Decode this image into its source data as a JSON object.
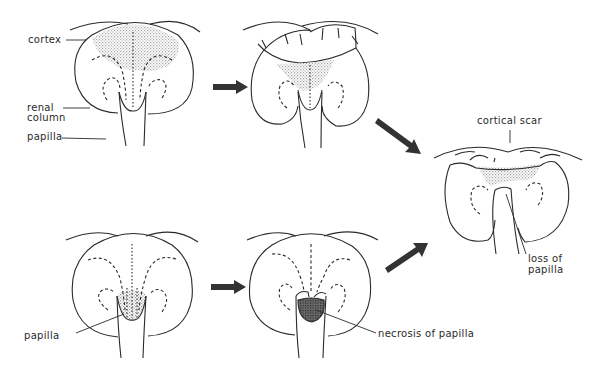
{
  "figure": {
    "colors": {
      "line": "#2a2a2a",
      "stipple": "#b8b8b8",
      "necrosis": "#555555",
      "arrow": "#333333"
    },
    "panels": [
      {
        "id": "top-left",
        "stage": "normal lobe with cortical involvement",
        "labels": [
          "cortex",
          "renal column",
          "papilla"
        ]
      },
      {
        "id": "top-middle",
        "stage": "cortical contraction",
        "labels": []
      },
      {
        "id": "bottom-left",
        "stage": "papillary involvement",
        "labels": [
          "papilla"
        ]
      },
      {
        "id": "bottom-middle",
        "stage": "papillary necrosis",
        "labels": [
          "necrosis of papilla"
        ]
      },
      {
        "id": "right",
        "stage": "end result",
        "labels": [
          "cortical scar",
          "loss of papilla"
        ]
      }
    ],
    "labels": {
      "cortex": "cortex",
      "renal": "renal",
      "column": "column",
      "papilla_top": "papilla",
      "papilla_bottom": "papilla",
      "necrosis": "necrosis of papilla",
      "cortical_scar": "cortical scar",
      "loss_of": "loss of",
      "papilla_loss": "papilla"
    },
    "arrows": [
      {
        "from": "top-left",
        "to": "top-middle"
      },
      {
        "from": "top-middle",
        "to": "right"
      },
      {
        "from": "bottom-left",
        "to": "bottom-middle"
      },
      {
        "from": "bottom-middle",
        "to": "right"
      }
    ]
  }
}
